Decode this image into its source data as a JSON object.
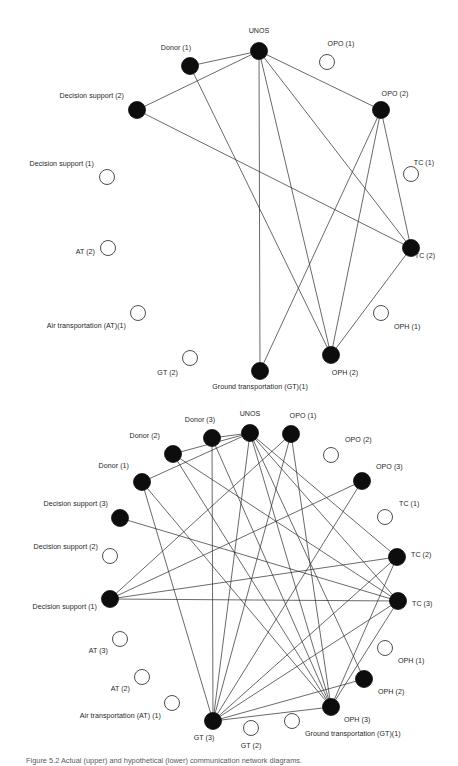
{
  "figure": {
    "caption": "Figure 5.2 Actual (upper) and hypothetical (lower) communication network diagrams."
  },
  "chart_data": {
    "type": "diagram",
    "title": "Communication network diagrams",
    "node_styles": {
      "filled": {
        "label": "participating actor",
        "fill": "#0d0d0d"
      },
      "open": {
        "label": "non-participating actor",
        "fill": "#ffffff",
        "stroke": "#3a3a3a"
      }
    },
    "panels": [
      {
        "name": "upper-network",
        "id": "net1",
        "nodes": [
          {
            "id": "unos",
            "label": "UNOS",
            "x": 259,
            "y": 51,
            "r": 8.5,
            "filled": true,
            "lx": 259,
            "ly": 33,
            "anchor": "middle"
          },
          {
            "id": "donor1",
            "label": "Donor (1)",
            "x": 190,
            "y": 66,
            "r": 8.5,
            "filled": true,
            "lx": 176,
            "ly": 50,
            "anchor": "middle"
          },
          {
            "id": "opo1",
            "label": "OPO (1)",
            "x": 327,
            "y": 62,
            "r": 7.5,
            "filled": false,
            "lx": 341,
            "ly": 46,
            "anchor": "middle"
          },
          {
            "id": "ds2",
            "label": "Decision support (2)",
            "x": 137,
            "y": 110,
            "r": 8.5,
            "filled": true,
            "lx": 124,
            "ly": 98,
            "anchor": "end"
          },
          {
            "id": "opo2",
            "label": "OPO (2)",
            "x": 381,
            "y": 110,
            "r": 8.5,
            "filled": true,
            "lx": 395,
            "ly": 96,
            "anchor": "middle"
          },
          {
            "id": "ds1",
            "label": "Decision support (1)",
            "x": 107,
            "y": 177,
            "r": 7.5,
            "filled": false,
            "lx": 94,
            "ly": 166,
            "anchor": "end"
          },
          {
            "id": "tc1",
            "label": "TC (1)",
            "x": 411,
            "y": 174,
            "r": 7.5,
            "filled": false,
            "lx": 424,
            "ly": 165,
            "anchor": "middle"
          },
          {
            "id": "at2",
            "label": "AT (2)",
            "x": 108,
            "y": 248,
            "r": 7.5,
            "filled": false,
            "lx": 95,
            "ly": 254,
            "anchor": "end"
          },
          {
            "id": "tc2",
            "label": "TC (2)",
            "x": 411,
            "y": 248,
            "r": 8.5,
            "filled": true,
            "lx": 425,
            "ly": 258,
            "anchor": "middle"
          },
          {
            "id": "at1",
            "label": "Air transportation (AT)(1)",
            "x": 138,
            "y": 313,
            "r": 7.5,
            "filled": false,
            "lx": 126,
            "ly": 328,
            "anchor": "end"
          },
          {
            "id": "oph1",
            "label": "OPH (1)",
            "x": 381,
            "y": 313,
            "r": 7.5,
            "filled": false,
            "lx": 394,
            "ly": 329,
            "anchor": "start"
          },
          {
            "id": "gt2",
            "label": "GT (2)",
            "x": 190,
            "y": 358,
            "r": 7.5,
            "filled": false,
            "lx": 178,
            "ly": 375,
            "anchor": "end"
          },
          {
            "id": "oph2",
            "label": "OPH (2)",
            "x": 331,
            "y": 355,
            "r": 8.5,
            "filled": true,
            "lx": 345,
            "ly": 375,
            "anchor": "middle"
          },
          {
            "id": "gt1",
            "label": "Ground transportation (GT)(1)",
            "x": 260,
            "y": 371,
            "r": 8.5,
            "filled": true,
            "lx": 260,
            "ly": 389,
            "anchor": "middle"
          }
        ],
        "edges": [
          [
            "unos",
            "donor1"
          ],
          [
            "unos",
            "ds2"
          ],
          [
            "unos",
            "opo2"
          ],
          [
            "unos",
            "tc2"
          ],
          [
            "unos",
            "oph2"
          ],
          [
            "unos",
            "gt1"
          ],
          [
            "donor1",
            "oph2"
          ],
          [
            "ds2",
            "tc2"
          ],
          [
            "opo2",
            "tc2"
          ],
          [
            "opo2",
            "oph2"
          ],
          [
            "opo2",
            "gt1"
          ],
          [
            "tc2",
            "oph2"
          ]
        ]
      },
      {
        "name": "lower-network",
        "id": "net2",
        "nodes": [
          {
            "id": "unos",
            "label": "UNOS",
            "x": 250,
            "y": 433,
            "r": 8.5,
            "filled": true,
            "lx": 250,
            "ly": 416,
            "anchor": "middle"
          },
          {
            "id": "donor3",
            "label": "Donor (3)",
            "x": 212,
            "y": 438,
            "r": 8.5,
            "filled": true,
            "lx": 200,
            "ly": 422,
            "anchor": "middle"
          },
          {
            "id": "opo1",
            "label": "OPO (1)",
            "x": 291,
            "y": 434,
            "r": 8.5,
            "filled": true,
            "lx": 303,
            "ly": 418,
            "anchor": "middle"
          },
          {
            "id": "donor2",
            "label": "Donor (2)",
            "x": 173,
            "y": 454,
            "r": 8.5,
            "filled": true,
            "lx": 160,
            "ly": 438,
            "anchor": "end"
          },
          {
            "id": "opo2",
            "label": "OPO (2)",
            "x": 331,
            "y": 455,
            "r": 7.5,
            "filled": false,
            "lx": 345,
            "ly": 442,
            "anchor": "start"
          },
          {
            "id": "donor1",
            "label": "Donor (1)",
            "x": 142,
            "y": 482,
            "r": 8.5,
            "filled": true,
            "lx": 129,
            "ly": 468,
            "anchor": "end"
          },
          {
            "id": "opo3",
            "label": "OPO (3)",
            "x": 362,
            "y": 481,
            "r": 8.5,
            "filled": true,
            "lx": 376,
            "ly": 469,
            "anchor": "start"
          },
          {
            "id": "ds3",
            "label": "Decision support (3)",
            "x": 120,
            "y": 518,
            "r": 8.5,
            "filled": true,
            "lx": 108,
            "ly": 506,
            "anchor": "end"
          },
          {
            "id": "tc1",
            "label": "TC (1)",
            "x": 385,
            "y": 517,
            "r": 7.5,
            "filled": false,
            "lx": 399,
            "ly": 506,
            "anchor": "start"
          },
          {
            "id": "ds2",
            "label": "Decision support (2)",
            "x": 110,
            "y": 556,
            "r": 7.5,
            "filled": false,
            "lx": 98,
            "ly": 549,
            "anchor": "end"
          },
          {
            "id": "tc2",
            "label": "TC (2)",
            "x": 397,
            "y": 557,
            "r": 8.5,
            "filled": true,
            "lx": 411,
            "ly": 557,
            "anchor": "start"
          },
          {
            "id": "ds1",
            "label": "Decision support (1)",
            "x": 110,
            "y": 599,
            "r": 8.5,
            "filled": true,
            "lx": 97,
            "ly": 609,
            "anchor": "end"
          },
          {
            "id": "tc3",
            "label": "TC (3)",
            "x": 398,
            "y": 601,
            "r": 8.5,
            "filled": true,
            "lx": 412,
            "ly": 606,
            "anchor": "start"
          },
          {
            "id": "at3",
            "label": "AT (3)",
            "x": 120,
            "y": 639,
            "r": 7.5,
            "filled": false,
            "lx": 108,
            "ly": 653,
            "anchor": "end"
          },
          {
            "id": "oph1",
            "label": "OPH (1)",
            "x": 385,
            "y": 648,
            "r": 7.5,
            "filled": false,
            "lx": 398,
            "ly": 663,
            "anchor": "start"
          },
          {
            "id": "at2",
            "label": "AT (2)",
            "x": 142,
            "y": 677,
            "r": 7.5,
            "filled": false,
            "lx": 130,
            "ly": 691,
            "anchor": "end"
          },
          {
            "id": "oph2",
            "label": "OPH (2)",
            "x": 364,
            "y": 679,
            "r": 8.5,
            "filled": true,
            "lx": 378,
            "ly": 694,
            "anchor": "start"
          },
          {
            "id": "at1",
            "label": "Air transportation (AT) (1)",
            "x": 172,
            "y": 703,
            "r": 7.5,
            "filled": false,
            "lx": 161,
            "ly": 718,
            "anchor": "end"
          },
          {
            "id": "oph3",
            "label": "OPH (3)",
            "x": 331,
            "y": 707,
            "r": 8.5,
            "filled": true,
            "lx": 344,
            "ly": 722,
            "anchor": "start"
          },
          {
            "id": "gt1",
            "label": "Ground transportation (GT)(1)",
            "x": 292,
            "y": 721,
            "r": 7.5,
            "filled": false,
            "lx": 305,
            "ly": 736,
            "anchor": "start"
          },
          {
            "id": "gt2",
            "label": "GT (2)",
            "x": 251,
            "y": 728,
            "r": 7.5,
            "filled": false,
            "lx": 251,
            "ly": 748,
            "anchor": "middle"
          },
          {
            "id": "gt3",
            "label": "GT (3)",
            "x": 213,
            "y": 721,
            "r": 8.5,
            "filled": true,
            "lx": 204,
            "ly": 740,
            "anchor": "middle"
          }
        ],
        "edges": [
          [
            "unos",
            "donor3"
          ],
          [
            "unos",
            "donor2"
          ],
          [
            "unos",
            "donor1"
          ],
          [
            "unos",
            "tc2"
          ],
          [
            "unos",
            "tc3"
          ],
          [
            "unos",
            "oph2"
          ],
          [
            "unos",
            "oph3"
          ],
          [
            "unos",
            "gt3"
          ],
          [
            "donor3",
            "oph3"
          ],
          [
            "donor3",
            "gt3"
          ],
          [
            "donor2",
            "tc3"
          ],
          [
            "donor2",
            "oph3"
          ],
          [
            "donor1",
            "oph3"
          ],
          [
            "donor1",
            "gt3"
          ],
          [
            "opo1",
            "ds1"
          ],
          [
            "opo1",
            "oph3"
          ],
          [
            "opo1",
            "gt3"
          ],
          [
            "opo3",
            "ds1"
          ],
          [
            "opo3",
            "gt3"
          ],
          [
            "ds3",
            "tc3"
          ],
          [
            "ds1",
            "tc2"
          ],
          [
            "ds1",
            "tc3"
          ],
          [
            "tc2",
            "gt3"
          ],
          [
            "tc2",
            "oph3"
          ],
          [
            "tc3",
            "gt3"
          ],
          [
            "tc3",
            "oph3"
          ],
          [
            "oph2",
            "gt3"
          ],
          [
            "oph3",
            "gt3"
          ]
        ]
      }
    ]
  }
}
